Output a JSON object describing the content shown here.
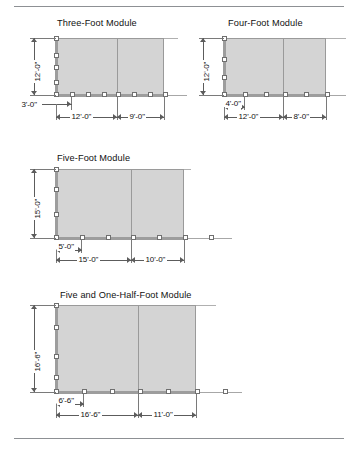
{
  "document": {
    "figure_type": "architectural-module-dimension-diagram",
    "shading_color": "#d4d4d4",
    "rail_color": "#9d9d9d",
    "node_color": "#ffffff"
  },
  "modules": [
    {
      "id": "three-foot",
      "title": "Three-Foot Module",
      "height_label": "12'-0\"",
      "offset_label": "3'-0\"",
      "bay_labels": [
        "12'-0\"",
        "9'-0\""
      ],
      "left_rail_nodes": 4,
      "base_rail_nodes": 8
    },
    {
      "id": "four-foot",
      "title": "Four-Foot Module",
      "height_label": "12'-0\"",
      "offset_label": "4'-0\"",
      "bay_labels": [
        "12'-0\"",
        "8'-0\""
      ],
      "left_rail_nodes": 3,
      "base_rail_nodes": 6
    },
    {
      "id": "five-foot",
      "title": "Five-Foot Module",
      "height_label": "15'-0\"",
      "offset_label": "5'-0\"",
      "bay_labels": [
        "15'-0\"",
        "10'-0\""
      ],
      "left_rail_nodes": 3,
      "base_rail_nodes": 7
    },
    {
      "id": "five-and-one-half-foot",
      "title": "Five and One-Half-Foot Module",
      "height_label": "16'-6\"",
      "offset_label": "6'-6\"",
      "bay_labels": [
        "16'-6\"",
        "11'-0\""
      ],
      "left_rail_nodes": 4,
      "base_rail_nodes": 7
    }
  ]
}
